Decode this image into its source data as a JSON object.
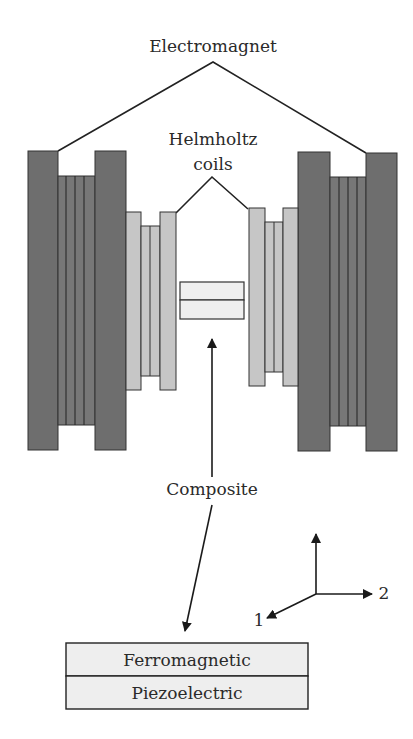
{
  "labels": {
    "electromagnet": "Electromagnet",
    "helmholtz_line1": "Helmholtz",
    "helmholtz_line2": "coils",
    "composite": "Composite",
    "layer_top": "Ferromagnetic",
    "layer_bottom": "Piezoelectric",
    "axis_1": "1",
    "axis_2": "2"
  },
  "colors": {
    "magnet_plate": "#6e6e6e",
    "magnet_coil": "#777777",
    "helmholtz": "#c6c6c6",
    "composite": "#efefef",
    "layer_fill": "#eeeeee",
    "stroke": "#222222"
  }
}
